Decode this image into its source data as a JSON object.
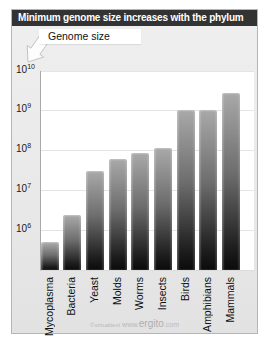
{
  "title": "Minimum genome size increases with the phylum",
  "callout": {
    "label": "Genome size"
  },
  "watermark": {
    "copyright": "©virtualtext",
    "www": " www.",
    "brand": "ergito",
    "domain": ".com"
  },
  "chart_data": {
    "type": "bar",
    "scale": "log",
    "title": "Minimum genome size increases with the phylum",
    "ylabel": "Genome size",
    "xlabel": "",
    "categories": [
      "Mycoplasma",
      "Bacteria",
      "Yeast",
      "Molds",
      "Worms",
      "Insects",
      "Birds",
      "Amphibians",
      "Mammals"
    ],
    "values": [
      500000,
      2400000,
      30000000,
      60000000,
      85000000,
      110000000,
      1000000000,
      1000000000,
      2800000000
    ],
    "ylim": [
      100000,
      10000000000
    ],
    "ytick_exponents": [
      6,
      7,
      8,
      9,
      10
    ],
    "grid": true,
    "legend": "none",
    "colors": {
      "bar_top": "#a8a8a8",
      "bar_bottom": "#0b0b0b",
      "titlebar_bg": "#333333",
      "titlebar_text": "#ffffff",
      "panel_bg": "#e9e9e9",
      "plot_bg": "#ffffff",
      "gridline": "#e4e4e4",
      "watermark": "#b9b9b9"
    }
  }
}
